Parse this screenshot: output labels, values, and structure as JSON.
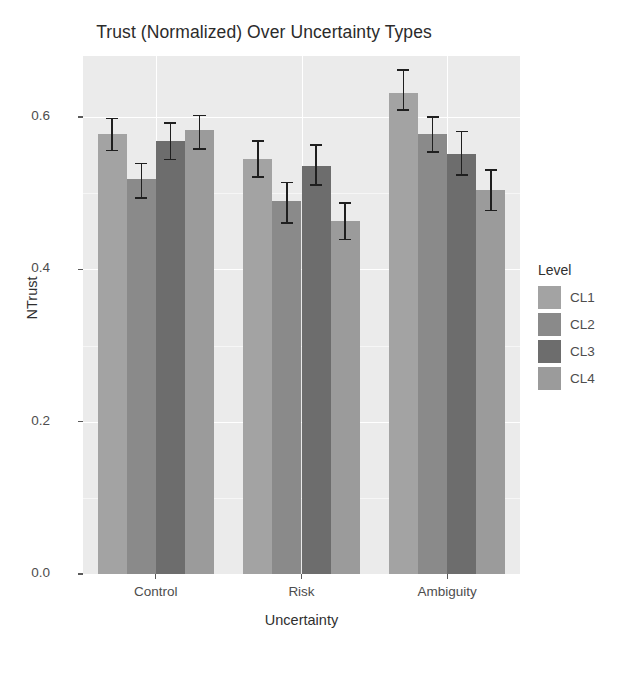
{
  "chart_data": {
    "type": "bar",
    "title": "Trust (Normalized) Over Uncertainty Types",
    "xlabel": "Uncertainty",
    "ylabel": "NTrust",
    "categories": [
      "Control",
      "Risk",
      "Ambiguity"
    ],
    "ylim": [
      0.0,
      0.68
    ],
    "yticks": [
      0.0,
      0.2,
      0.4,
      0.6
    ],
    "ytick_labels": [
      "0.0",
      "0.2",
      "0.4",
      "0.6"
    ],
    "grid": true,
    "legend": {
      "title": "Level",
      "position": "right",
      "entries": [
        "CL1",
        "CL2",
        "CL3",
        "CL4"
      ]
    },
    "errorbars": true,
    "series": [
      {
        "name": "CL1",
        "color": "#a3a3a3",
        "values": [
          0.578,
          0.545,
          0.632
        ],
        "err_low": [
          0.556,
          0.521,
          0.609
        ],
        "err_high": [
          0.598,
          0.568,
          0.662
        ]
      },
      {
        "name": "CL2",
        "color": "#8a8a8a",
        "values": [
          0.518,
          0.49,
          0.578
        ],
        "err_low": [
          0.494,
          0.461,
          0.554
        ],
        "err_high": [
          0.539,
          0.514,
          0.6
        ]
      },
      {
        "name": "CL3",
        "color": "#6d6d6d",
        "values": [
          0.569,
          0.536,
          0.551
        ],
        "err_low": [
          0.544,
          0.511,
          0.524
        ],
        "err_high": [
          0.592,
          0.563,
          0.581
        ]
      },
      {
        "name": "CL4",
        "color": "#9b9b9b",
        "values": [
          0.583,
          0.463,
          0.504
        ],
        "err_low": [
          0.558,
          0.439,
          0.477
        ],
        "err_high": [
          0.602,
          0.487,
          0.53
        ]
      }
    ]
  },
  "panel": {
    "background": "#ebebeb",
    "gridline_color": "#ffffff"
  }
}
